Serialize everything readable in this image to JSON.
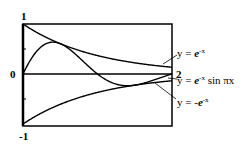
{
  "chart_data": {
    "type": "line",
    "title": "",
    "xlabel": "",
    "ylabel": "",
    "xlim": [
      0,
      2
    ],
    "ylim": [
      -1,
      1
    ],
    "grid": false,
    "y_ticks": [
      -1,
      -0.5,
      0,
      0.5,
      1
    ],
    "tick_labels": {
      "y_top": "1",
      "y_zero": "0",
      "y_bottom": "-1",
      "x_right": "2"
    },
    "series": [
      {
        "name": "y = e^-x",
        "label_prefix": "y = ",
        "label_base": "e",
        "label_sup": "-x",
        "label_suffix": "",
        "expr": "exp(-x)"
      },
      {
        "name": "y = e^-x sin πx",
        "label_prefix": "y = ",
        "label_base": "e",
        "label_sup": "-x",
        "label_suffix": " sin πx",
        "expr": "exp(-x)*sin(pi*x)"
      },
      {
        "name": "y = -e^-x",
        "label_prefix": "y = -",
        "label_base": "e",
        "label_sup": "-x",
        "label_suffix": "",
        "expr": "-exp(-x)"
      }
    ],
    "legend_position": "right, with leader lines"
  }
}
